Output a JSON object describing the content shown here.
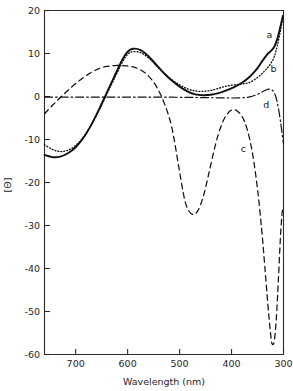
{
  "chart_data": {
    "type": "line",
    "title": "",
    "xlabel": "Wavelength (nm)",
    "ylabel": "[Θ]",
    "xlim": [
      760,
      300
    ],
    "ylim": [
      -60,
      20
    ],
    "x_reversed": true,
    "grid": false,
    "legend_position": "inline-curve-labels",
    "xticks": [
      700,
      600,
      500,
      400,
      300
    ],
    "xtick_labels": [
      "700",
      "600",
      "500",
      "400",
      "300"
    ],
    "yticks": [
      20,
      10,
      0,
      -10,
      -20,
      -30,
      -40,
      -50,
      -60
    ],
    "ytick_labels": [
      "20",
      "10",
      "0",
      "-10",
      "-20",
      "-30",
      "-40",
      "-50",
      "-60"
    ],
    "series": [
      {
        "name": "a",
        "label": "a",
        "style": "solid",
        "color": "#111111",
        "label_x": 327,
        "label_y": 13.6,
        "x": [
          760,
          745,
          730,
          715,
          700,
          685,
          670,
          655,
          640,
          625,
          610,
          600,
          590,
          575,
          560,
          545,
          530,
          515,
          500,
          485,
          470,
          455,
          440,
          425,
          410,
          395,
          380,
          365,
          350,
          340,
          332,
          325,
          318,
          312,
          306,
          301
        ],
        "y": [
          -13.6,
          -14.1,
          -14.0,
          -13.2,
          -11.8,
          -9.6,
          -6.6,
          -3.0,
          0.9,
          4.8,
          8.6,
          10.4,
          11.1,
          10.8,
          9.4,
          7.4,
          5.4,
          3.7,
          2.3,
          1.2,
          0.5,
          0.3,
          0.4,
          0.8,
          1.4,
          2.2,
          3.2,
          4.6,
          6.6,
          8.4,
          9.7,
          10.5,
          11.5,
          13.4,
          16.2,
          18.8
        ]
      },
      {
        "name": "b",
        "label": "b",
        "style": "dotted",
        "color": "#111111",
        "label_x": 319,
        "label_y": 5.6,
        "x": [
          760,
          745,
          730,
          715,
          700,
          685,
          670,
          655,
          640,
          625,
          610,
          600,
          590,
          575,
          560,
          545,
          530,
          515,
          500,
          485,
          470,
          455,
          440,
          425,
          410,
          395,
          380,
          365,
          350,
          340,
          332,
          325,
          318,
          312,
          306,
          301
        ],
        "y": [
          -11.2,
          -12.3,
          -12.8,
          -12.5,
          -11.4,
          -9.4,
          -6.6,
          -3.2,
          0.6,
          4.3,
          8.0,
          9.8,
          10.4,
          10.2,
          9.0,
          7.2,
          5.4,
          3.9,
          2.7,
          1.8,
          1.3,
          1.2,
          1.4,
          1.9,
          2.4,
          2.7,
          2.9,
          3.3,
          4.4,
          5.5,
          6.5,
          7.6,
          9.2,
          11.8,
          15.2,
          18.6
        ]
      },
      {
        "name": "c",
        "label": "c",
        "style": "dashed",
        "color": "#111111",
        "label_x": 377,
        "label_y": -12.8,
        "x": [
          760,
          745,
          730,
          715,
          700,
          685,
          670,
          655,
          640,
          625,
          610,
          600,
          590,
          575,
          560,
          545,
          530,
          515,
          500,
          492,
          485,
          475,
          465,
          455,
          445,
          435,
          425,
          415,
          405,
          398,
          390,
          380,
          370,
          360,
          350,
          342,
          336,
          330,
          325,
          322,
          318,
          314,
          310,
          306,
          303,
          301
        ],
        "y": [
          -4.0,
          -2.1,
          -0.3,
          1.4,
          3.0,
          4.4,
          5.6,
          6.5,
          7.0,
          7.2,
          7.2,
          7.1,
          6.9,
          6.2,
          4.8,
          2.4,
          -1.4,
          -7.2,
          -17.5,
          -23.0,
          -26.0,
          -27.4,
          -26.6,
          -23.5,
          -18.6,
          -13.2,
          -8.6,
          -5.4,
          -3.6,
          -3.1,
          -3.3,
          -4.6,
          -7.6,
          -13.0,
          -21.5,
          -31.0,
          -39.5,
          -48.5,
          -55.0,
          -57.5,
          -57.0,
          -52.0,
          -43.0,
          -33.0,
          -27.5,
          -26.0
        ]
      },
      {
        "name": "d",
        "label": "d",
        "style": "dash-dot",
        "color": "#111111",
        "label_x": 333,
        "label_y": -2.6,
        "x": [
          760,
          730,
          700,
          670,
          640,
          610,
          580,
          550,
          520,
          490,
          460,
          430,
          400,
          380,
          365,
          352,
          342,
          334,
          328,
          322,
          318,
          314,
          310,
          306,
          302,
          300
        ],
        "y": [
          -0.15,
          -0.15,
          -0.15,
          -0.15,
          -0.15,
          -0.15,
          -0.15,
          -0.15,
          -0.15,
          -0.2,
          -0.25,
          -0.3,
          -0.35,
          -0.3,
          -0.1,
          0.4,
          1.0,
          1.5,
          1.7,
          1.5,
          0.9,
          -0.4,
          -2.6,
          -5.6,
          -9.2,
          -11.0
        ]
      }
    ]
  },
  "axes": {
    "ylabel": "[Θ]",
    "xlabel": "Wavelength (nm)"
  }
}
